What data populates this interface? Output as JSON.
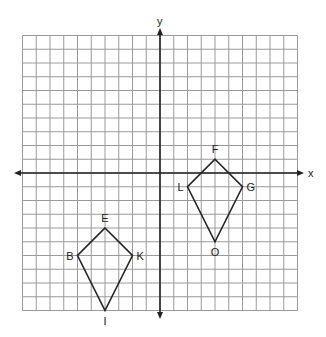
{
  "diagram": {
    "type": "coordinate-plane",
    "axes": {
      "x_label": "x",
      "y_label": "y",
      "x_range": [
        -10,
        10
      ],
      "y_range": [
        -10,
        10
      ],
      "grid": true,
      "grid_step": 1
    },
    "colors": {
      "grid": "#9a9a9a",
      "axis": "#222222",
      "shape": "#222222",
      "background": "#ffffff"
    },
    "shapes": [
      {
        "name": "kite-EKIB",
        "vertices": [
          {
            "label": "E",
            "x": -4,
            "y": -4,
            "label_pos": "above"
          },
          {
            "label": "K",
            "x": -2,
            "y": -6,
            "label_pos": "right"
          },
          {
            "label": "I",
            "x": -4,
            "y": -10,
            "label_pos": "below"
          },
          {
            "label": "B",
            "x": -6,
            "y": -6,
            "label_pos": "left"
          }
        ]
      },
      {
        "name": "kite-FGOL",
        "vertices": [
          {
            "label": "F",
            "x": 4,
            "y": 1,
            "label_pos": "above"
          },
          {
            "label": "G",
            "x": 6,
            "y": -1,
            "label_pos": "right"
          },
          {
            "label": "O",
            "x": 4,
            "y": -5,
            "label_pos": "below"
          },
          {
            "label": "L",
            "x": 2,
            "y": -1,
            "label_pos": "left"
          }
        ]
      }
    ]
  }
}
